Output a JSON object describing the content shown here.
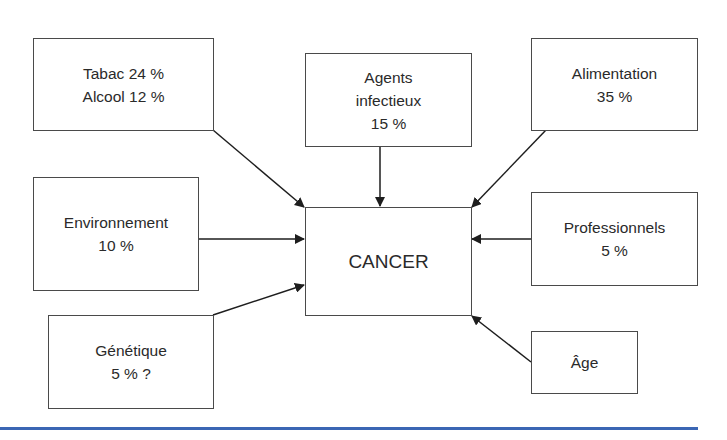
{
  "diagram": {
    "center": {
      "label": "CANCER"
    },
    "factors": [
      {
        "id": "tabac-alcool",
        "lines": [
          "Tabac 24 %",
          "Alcool 12 %"
        ]
      },
      {
        "id": "agents-infectieux",
        "lines": [
          "Agents",
          "infectieux",
          "15 %"
        ]
      },
      {
        "id": "alimentation",
        "lines": [
          "Alimentation",
          "35 %"
        ]
      },
      {
        "id": "environnement",
        "lines": [
          "Environnement",
          "10 %"
        ]
      },
      {
        "id": "professionnels",
        "lines": [
          "Professionnels",
          "5 %"
        ]
      },
      {
        "id": "genetique",
        "lines": [
          "Génétique",
          "5 % ?"
        ]
      },
      {
        "id": "age",
        "lines": [
          "Âge"
        ]
      }
    ],
    "colors": {
      "box_border": "#4a4a4a",
      "arrow": "#1e1e1e",
      "text": "#2a2a2a",
      "rule": "#3b66b4"
    }
  }
}
